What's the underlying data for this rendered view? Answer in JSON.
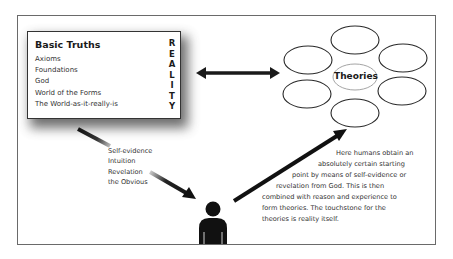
{
  "diagram": {
    "basic_truths": {
      "title": "Basic Truths",
      "items": [
        "Axioms",
        "Foundations",
        "God",
        "World of the Forms",
        "The World-as-it-really-is"
      ],
      "side_label_letters": [
        "R",
        "E",
        "A",
        "L",
        "I",
        "T",
        "Y"
      ],
      "side_label": "REALITY"
    },
    "theories": {
      "label": "Theories",
      "ellipse_count": 7
    },
    "methods": {
      "items": [
        "Self-evidence",
        "Intuition",
        "Revelation",
        "the Obvious"
      ]
    },
    "description": {
      "lines": [
        "Here humans obtain an",
        "absolutely certain starting",
        "point by means of self-evidence or",
        "revelation from God. This is then",
        "combined with reason and experience to",
        "form theories. The touchstone for the",
        "theories is reality itself."
      ]
    },
    "icons": {
      "person": "person-icon",
      "double_arrow": "double-arrow-icon",
      "arrow_to_person": "arrow-down-right-icon",
      "arrow_to_theories": "arrow-up-right-icon"
    },
    "colors": {
      "ink": "#1a1a1a",
      "frame": "#6a6a6a",
      "background": "#ffffff",
      "ellipse_center_stroke": "#9a9a9a"
    }
  }
}
